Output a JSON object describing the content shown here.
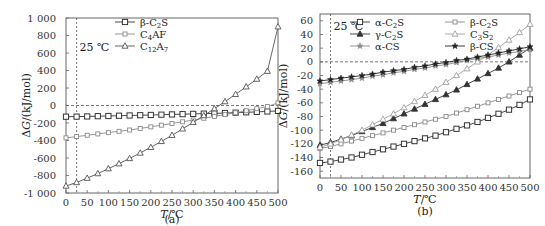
{
  "chart_data": [
    {
      "type": "line",
      "panel_label": "(a)",
      "title": "",
      "xlabel": "T/℃",
      "ylabel": "ΔG/(kJ/mol)",
      "xlim": [
        0,
        500
      ],
      "ylim": [
        -1000,
        1000
      ],
      "xticks": [
        0,
        50,
        100,
        150,
        200,
        250,
        300,
        350,
        400,
        450,
        500
      ],
      "yticks": [
        1000,
        800,
        600,
        400,
        200,
        0,
        -200,
        -400,
        -600,
        -800,
        -1000
      ],
      "ytick_labels": [
        "1 000",
        "800",
        "600",
        "400",
        "200",
        "0",
        "-200",
        "-400",
        "-600",
        "-800",
        "-1 000"
      ],
      "annotation": "25 ℃",
      "reference_lines": {
        "vertical_x": 25,
        "horizontal_y": 0
      },
      "grid": false,
      "legend_position": "upper right",
      "x": [
        0,
        25,
        50,
        75,
        100,
        125,
        150,
        175,
        200,
        225,
        250,
        275,
        300,
        325,
        350,
        375,
        400,
        425,
        450,
        475,
        500
      ],
      "series": [
        {
          "name": "β-C2S",
          "display": [
            "β-C",
            "2",
            "S"
          ],
          "marker": "square",
          "color": "#333333",
          "values": [
            -128,
            -127,
            -125,
            -122,
            -120,
            -117,
            -114,
            -111,
            -108,
            -105,
            -102,
            -99,
            -96,
            -93,
            -90,
            -86,
            -82,
            -78,
            -73,
            -68,
            -62
          ]
        },
        {
          "name": "C4AF",
          "display": [
            "C",
            "4",
            "AF"
          ],
          "marker": "square-small",
          "color": "#8a8a8a",
          "values": [
            -370,
            -355,
            -340,
            -325,
            -310,
            -295,
            -280,
            -262,
            -244,
            -225,
            -206,
            -186,
            -166,
            -146,
            -125,
            -104,
            -83,
            -60,
            -36,
            -12,
            30
          ]
        },
        {
          "name": "C12A7",
          "display": [
            "C",
            "12",
            "A",
            "7"
          ],
          "marker": "triangle",
          "color": "#555555",
          "values": [
            -920,
            -880,
            -830,
            -778,
            -722,
            -665,
            -605,
            -543,
            -478,
            -410,
            -340,
            -267,
            -192,
            -115,
            -36,
            45,
            128,
            214,
            302,
            392,
            900
          ]
        }
      ]
    },
    {
      "type": "line",
      "panel_label": "(b)",
      "title": "",
      "xlabel": "T/℃",
      "ylabel": "ΔG/(kJ/mol)",
      "xlim": [
        0,
        500
      ],
      "ylim": [
        -170,
        70
      ],
      "xticks": [
        0,
        50,
        100,
        150,
        200,
        250,
        300,
        350,
        400,
        450,
        500
      ],
      "yticks": [
        60,
        40,
        20,
        0,
        -20,
        -40,
        -60,
        -80,
        -100,
        -120,
        -140,
        -160
      ],
      "ytick_labels": [
        "60",
        "40",
        "20",
        "0",
        "-20",
        "-40",
        "-60",
        "-80",
        "-100",
        "-120",
        "-140",
        "-160"
      ],
      "annotation": "25 ℃",
      "reference_lines": {
        "vertical_x": 25,
        "horizontal_y": 0
      },
      "grid": false,
      "legend_position": "upper center (two columns)",
      "x": [
        0,
        25,
        50,
        75,
        100,
        125,
        150,
        175,
        200,
        225,
        250,
        275,
        300,
        325,
        350,
        375,
        400,
        425,
        450,
        475,
        500
      ],
      "series": [
        {
          "name": "α-C2S",
          "display": [
            "α-C",
            "2",
            "S"
          ],
          "marker": "square",
          "color": "#333333",
          "values": [
            -148,
            -146,
            -143,
            -140,
            -136,
            -132,
            -128,
            -124,
            -120,
            -116,
            -112,
            -108,
            -103,
            -98,
            -93,
            -88,
            -82,
            -76,
            -70,
            -63,
            -55
          ]
        },
        {
          "name": "β-C2S",
          "display": [
            "β-C",
            "2",
            "S"
          ],
          "marker": "square-small",
          "color": "#8a8a8a",
          "values": [
            -127,
            -124,
            -120,
            -116,
            -112,
            -108,
            -104,
            -100,
            -96,
            -92,
            -88,
            -84,
            -80,
            -75,
            -70,
            -65,
            -60,
            -55,
            -50,
            -45,
            -40
          ]
        },
        {
          "name": "γ-C2S",
          "display": [
            "γ-C",
            "2",
            "S"
          ],
          "marker": "triangle-filled",
          "color": "#333333",
          "values": [
            -122,
            -118,
            -113,
            -108,
            -102,
            -96,
            -90,
            -83,
            -76,
            -69,
            -62,
            -55,
            -48,
            -41,
            -33,
            -25,
            -17,
            -9,
            0,
            10,
            20
          ]
        },
        {
          "name": "C3S2",
          "display": [
            "C",
            "3",
            "S",
            "2"
          ],
          "marker": "triangle",
          "color": "#a0a0a0",
          "values": [
            -125,
            -120,
            -114,
            -107,
            -100,
            -92,
            -84,
            -76,
            -67,
            -58,
            -49,
            -40,
            -30,
            -20,
            -10,
            0,
            10,
            21,
            32,
            43,
            55
          ]
        },
        {
          "name": "α-CS",
          "display": [
            "α-CS"
          ],
          "marker": "star",
          "color": "#8a8a8a",
          "values": [
            -32,
            -30,
            -28,
            -26,
            -24,
            -21,
            -19,
            -16,
            -14,
            -11,
            -9,
            -6,
            -4,
            -1,
            2,
            5,
            7,
            10,
            13,
            15,
            18
          ]
        },
        {
          "name": "β-CS",
          "display": [
            "β-CS"
          ],
          "marker": "star-filled",
          "color": "#222222",
          "values": [
            -28,
            -26,
            -24,
            -22,
            -20,
            -18,
            -15,
            -13,
            -11,
            -8,
            -6,
            -3,
            -1,
            2,
            4,
            7,
            10,
            13,
            16,
            19,
            22
          ]
        }
      ]
    }
  ]
}
